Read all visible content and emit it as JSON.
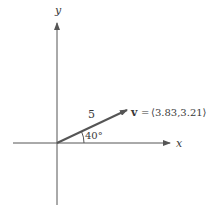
{
  "diagram": {
    "type": "vector-diagram",
    "axes": {
      "x_label": "x",
      "y_label": "y"
    },
    "vector": {
      "name": "v",
      "magnitude_label": "5",
      "angle_label": "40°",
      "equals": "=",
      "components_label": "⟨3.83,3.21⟩",
      "magnitude": 5,
      "angle_deg": 40,
      "x_component": 3.83,
      "y_component": 3.21
    },
    "colors": {
      "axis": "#555555",
      "vector": "#555555",
      "text": "#3a3a3a"
    }
  }
}
